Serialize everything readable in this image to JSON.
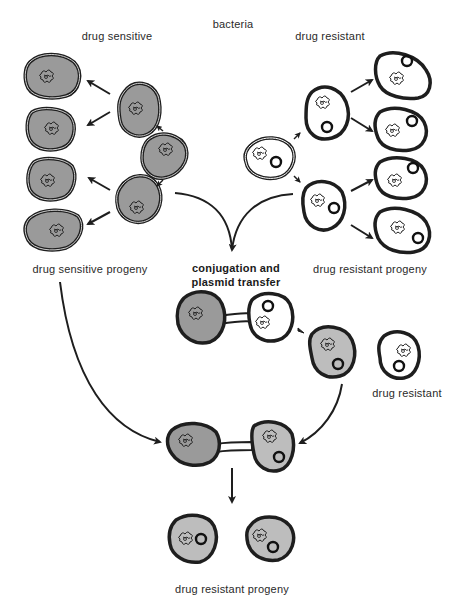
{
  "title": "bacteria",
  "labels": {
    "drug_sensitive": "drug sensitive",
    "drug_resistant": "drug resistant",
    "drug_sensitive_progeny": "drug sensitive progeny",
    "drug_resistant_progeny_top": "drug resistant progeny",
    "conjugation_line1": "conjugation and",
    "conjugation_line2": "plasmid transfer",
    "drug_resistant_single": "drug resistant",
    "drug_resistant_progeny_bottom": "drug resistant progeny"
  },
  "colors": {
    "sensitive_fill": "#9a9a9a",
    "recipient_fill": "#bdbdbd",
    "resistant_fill": "#ffffff",
    "outline": "#1e1e1e",
    "background": "#ffffff"
  },
  "legend_semantics": {
    "grey_cell": "drug sensitive bacterium",
    "white_cell_with_ring": "drug resistant bacterium (plasmid shown as ring)",
    "ring_glyph": "plasmid",
    "squiggle_glyph": "chromosome"
  }
}
